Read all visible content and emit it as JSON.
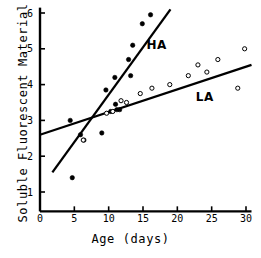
{
  "chart_data": {
    "type": "scatter",
    "title": "",
    "xlabel": "Age (days)",
    "ylabel": "Soluble Fluorescent Material",
    "xlim": [
      0,
      31
    ],
    "ylim": [
      0,
      6.2
    ],
    "xticks": [
      0,
      5,
      10,
      15,
      20,
      25,
      30
    ],
    "yticks": [
      1,
      2,
      3,
      4,
      5,
      6
    ],
    "xtick_labels": [
      "0",
      "5",
      "10",
      "15",
      "20",
      "25",
      "30"
    ],
    "ytick_labels": [
      "1",
      "2",
      "3",
      "4",
      "5",
      "6"
    ],
    "grid": false,
    "legend_position": "inline-annotation",
    "series": [
      {
        "name": "HA",
        "label": "HA",
        "marker": "filled-circle",
        "color": "#000000",
        "points": [
          {
            "x": 4.4,
            "y": 3.0
          },
          {
            "x": 4.7,
            "y": 1.4
          },
          {
            "x": 5.9,
            "y": 2.6
          },
          {
            "x": 6.4,
            "y": 2.45
          },
          {
            "x": 9.0,
            "y": 2.65
          },
          {
            "x": 9.6,
            "y": 3.85
          },
          {
            "x": 10.3,
            "y": 3.25
          },
          {
            "x": 10.9,
            "y": 4.2
          },
          {
            "x": 11.0,
            "y": 3.45
          },
          {
            "x": 11.2,
            "y": 3.3
          },
          {
            "x": 11.6,
            "y": 3.3
          },
          {
            "x": 12.9,
            "y": 4.7
          },
          {
            "x": 13.2,
            "y": 4.25
          },
          {
            "x": 13.5,
            "y": 5.1
          },
          {
            "x": 14.9,
            "y": 5.7
          },
          {
            "x": 16.1,
            "y": 5.95
          }
        ],
        "fit_line": {
          "x1": 1.8,
          "y1": 1.55,
          "x2": 19.0,
          "y2": 6.1
        }
      },
      {
        "name": "LA",
        "label": "LA",
        "marker": "open-circle",
        "color": "#000000",
        "points": [
          {
            "x": 6.3,
            "y": 2.45
          },
          {
            "x": 9.7,
            "y": 3.2
          },
          {
            "x": 10.6,
            "y": 3.25
          },
          {
            "x": 11.8,
            "y": 3.55
          },
          {
            "x": 12.6,
            "y": 3.5
          },
          {
            "x": 14.6,
            "y": 3.75
          },
          {
            "x": 16.3,
            "y": 3.9
          },
          {
            "x": 18.9,
            "y": 4.0
          },
          {
            "x": 21.6,
            "y": 4.25
          },
          {
            "x": 23.0,
            "y": 4.55
          },
          {
            "x": 24.3,
            "y": 4.35
          },
          {
            "x": 25.9,
            "y": 4.7
          },
          {
            "x": 28.8,
            "y": 3.9
          },
          {
            "x": 29.8,
            "y": 5.0
          }
        ],
        "fit_line": {
          "x1": 0.0,
          "y1": 2.6,
          "x2": 30.8,
          "y2": 4.55
        }
      }
    ],
    "annotations": [
      {
        "text": "HA",
        "x": 17.0,
        "y": 5.0
      },
      {
        "text": "LA",
        "x": 24.0,
        "y": 3.55
      }
    ]
  }
}
